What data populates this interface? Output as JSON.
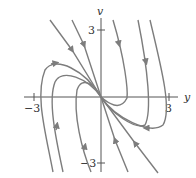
{
  "diagram": {
    "type": "phase-portrait",
    "axes": {
      "x_label": "y",
      "y_label": "v",
      "x_ticks": [
        {
          "value": -3,
          "label": "−3"
        },
        {
          "value": 3,
          "label": "3"
        }
      ],
      "y_ticks": [
        {
          "value": 3,
          "label": "3"
        },
        {
          "value": -3,
          "label": "−3"
        }
      ]
    },
    "colors": {
      "curve": "#7d7d7d",
      "axis": "#555555",
      "text": "#333333"
    },
    "trajectories": [
      "straight-line solution through origin, arrows toward origin from upper-left and lower-right",
      "curves approaching origin tangent to slow eigen-direction",
      "curves from top descending and turning at lower-right",
      "curves from bottom ascending and turning at upper-left"
    ]
  }
}
